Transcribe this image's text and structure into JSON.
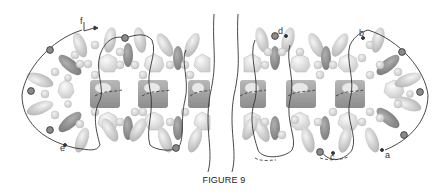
{
  "figure": {
    "caption": "FIGURE 9",
    "labels": [
      {
        "id": "a",
        "text": "a",
        "x": 385,
        "y": 155
      },
      {
        "id": "b",
        "text": "b",
        "x": 362,
        "y": 36
      },
      {
        "id": "c",
        "text": "c",
        "x": 336,
        "y": 156
      },
      {
        "id": "d",
        "text": "d",
        "x": 278,
        "y": 31
      },
      {
        "id": "e",
        "text": "e",
        "x": 60,
        "y": 150
      },
      {
        "id": "f",
        "text": "f",
        "x": 82,
        "y": 27
      }
    ],
    "colors": {
      "background": "#ffffff",
      "line": "#333333",
      "node_fill": "#8a8a8a",
      "ellipse_light": "#cfcfcf",
      "ellipse_dark": "#8f8f8f",
      "block": "#9a9a9a",
      "small_sphere": "#d6d6d6"
    }
  }
}
